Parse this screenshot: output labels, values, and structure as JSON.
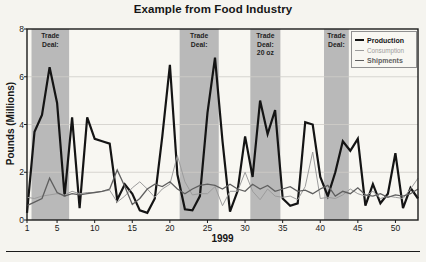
{
  "chart_data": {
    "type": "line",
    "title": "Example from Food Industry",
    "xlabel": "1999",
    "ylabel": "Pounds (Millions)",
    "xlim": [
      1,
      53
    ],
    "ylim": [
      0,
      8
    ],
    "x_ticks": [
      1,
      5,
      10,
      15,
      20,
      25,
      30,
      35,
      40,
      45,
      50
    ],
    "y_ticks": [
      0,
      2,
      4,
      6,
      8
    ],
    "grid": "horizontal gridlines at 2, 4, 6",
    "legend_position": "top-right inside plot",
    "x": [
      1,
      2,
      3,
      4,
      5,
      6,
      7,
      8,
      9,
      10,
      11,
      12,
      13,
      14,
      15,
      16,
      17,
      18,
      19,
      20,
      21,
      22,
      23,
      24,
      25,
      26,
      27,
      28,
      29,
      30,
      31,
      32,
      33,
      34,
      35,
      36,
      37,
      38,
      39,
      40,
      41,
      42,
      43,
      44,
      45,
      46,
      47,
      48,
      49,
      50,
      51,
      52,
      53
    ],
    "series": [
      {
        "name": "Production",
        "color": "#141414",
        "stroke_width": 2.2,
        "values": [
          0.3,
          3.7,
          4.4,
          6.4,
          4.9,
          1.0,
          4.3,
          0.5,
          4.3,
          3.4,
          3.3,
          3.2,
          0.85,
          1.5,
          1.1,
          0.4,
          0.3,
          0.9,
          3.5,
          6.5,
          1.9,
          0.45,
          0.4,
          1.0,
          4.5,
          6.8,
          3.3,
          0.35,
          1.2,
          3.5,
          1.8,
          5.0,
          3.6,
          4.6,
          0.9,
          0.6,
          0.7,
          4.1,
          4.0,
          1.8,
          1.0,
          2.0,
          3.3,
          2.9,
          3.4,
          0.6,
          1.5,
          0.7,
          1.1,
          2.8,
          0.5,
          1.35,
          0.9
        ]
      },
      {
        "name": "Consumption",
        "color": "#9c9c9c",
        "stroke_width": 1.0,
        "values": [
          0.95,
          0.9,
          1.0,
          1.05,
          1.1,
          1.05,
          1.2,
          1.1,
          1.15,
          1.15,
          1.2,
          1.25,
          0.75,
          1.0,
          1.35,
          1.6,
          1.3,
          0.95,
          1.3,
          1.5,
          2.7,
          1.6,
          1.05,
          1.1,
          1.1,
          1.4,
          0.6,
          1.2,
          1.2,
          2.0,
          1.2,
          0.85,
          1.3,
          1.0,
          0.95,
          1.0,
          0.85,
          1.4,
          2.85,
          0.9,
          0.95,
          0.9,
          1.05,
          1.3,
          1.1,
          1.0,
          1.2,
          0.9,
          1.0,
          0.95,
          0.9,
          1.3,
          1.75
        ]
      },
      {
        "name": "Shipments",
        "color": "#5f5f5f",
        "stroke_width": 1.3,
        "values": [
          0.6,
          0.75,
          0.9,
          1.75,
          1.15,
          1.0,
          1.1,
          1.05,
          1.1,
          1.15,
          1.2,
          1.3,
          2.1,
          1.4,
          0.65,
          0.9,
          1.3,
          1.5,
          1.4,
          1.6,
          1.3,
          1.1,
          1.3,
          1.45,
          1.5,
          1.45,
          1.3,
          1.5,
          1.3,
          1.2,
          1.5,
          1.3,
          1.45,
          1.2,
          1.3,
          1.4,
          1.2,
          1.25,
          1.1,
          1.3,
          1.45,
          1.0,
          1.2,
          1.1,
          1.35,
          1.05,
          1.0,
          1.1,
          0.95,
          1.05,
          1.0,
          1.1,
          1.3
        ]
      }
    ],
    "shaded_regions": [
      {
        "label": "Trade Deal:",
        "label_lines": [
          "Trade",
          "Deal:"
        ],
        "x_start": 1.6,
        "x_end": 6.6
      },
      {
        "label": "Trade Deal:",
        "label_lines": [
          "Trade",
          "Deal:"
        ],
        "x_start": 21.3,
        "x_end": 26.5
      },
      {
        "label": "Trade Deal: 20 oz",
        "label_lines": [
          "Trade",
          "Deal:",
          "20 oz"
        ],
        "x_start": 30.7,
        "x_end": 34.7
      },
      {
        "label": "Trade Deal:",
        "label_lines": [
          "Trade",
          "Deal:"
        ],
        "x_start": 40.5,
        "x_end": 43.8
      }
    ],
    "band_color": "#b9b9b9",
    "plot_background": "#f8f7f2",
    "grid_color": "#cfcdc8",
    "border_color": "#1c1c1c"
  },
  "legend": {
    "items": [
      {
        "label": "Production"
      },
      {
        "label": "Consumption"
      },
      {
        "label": "Shipments"
      }
    ]
  }
}
